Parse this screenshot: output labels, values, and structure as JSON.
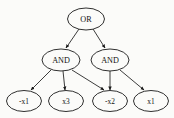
{
  "figure": {
    "background_color": "#fbfbf9",
    "stroke_color": "#1a1a1a",
    "width": 174,
    "height": 118
  },
  "graph": {
    "type": "directed-acyclic-graph",
    "levels": 3,
    "nodes": [
      {
        "id": "or",
        "label": "OR",
        "kind": "gate",
        "level": 0,
        "cx": 86,
        "cy": 19,
        "rx": 18.5,
        "ry": 11.0
      },
      {
        "id": "and1",
        "label": "AND",
        "kind": "gate",
        "level": 1,
        "cx": 61,
        "cy": 60,
        "rx": 19.0,
        "ry": 11.0
      },
      {
        "id": "and2",
        "label": "AND",
        "kind": "gate",
        "level": 1,
        "cx": 110,
        "cy": 60,
        "rx": 19.0,
        "ry": 11.0
      },
      {
        "id": "l1",
        "label": "-x1",
        "kind": "leaf",
        "level": 2,
        "cx": 24,
        "cy": 101,
        "rx": 17.5,
        "ry": 10.5
      },
      {
        "id": "l2",
        "label": "x3",
        "kind": "leaf",
        "level": 2,
        "cx": 66,
        "cy": 101,
        "rx": 17.5,
        "ry": 10.5
      },
      {
        "id": "l3",
        "label": "-x2",
        "kind": "leaf",
        "level": 2,
        "cx": 110,
        "cy": 101,
        "rx": 17.5,
        "ry": 10.5
      },
      {
        "id": "l4",
        "label": "x1",
        "kind": "leaf",
        "level": 2,
        "cx": 151,
        "cy": 101,
        "rx": 17.5,
        "ry": 10.5
      }
    ],
    "edges": [
      {
        "from": "or",
        "to": "and1",
        "x1": 79,
        "y1": 29,
        "x2": 66,
        "y2": 48
      },
      {
        "from": "or",
        "to": "and2",
        "x1": 93,
        "y1": 29,
        "x2": 105,
        "y2": 48
      },
      {
        "from": "and1",
        "to": "l1",
        "x1": 51,
        "y1": 70,
        "x2": 31,
        "y2": 90
      },
      {
        "from": "and1",
        "to": "l2",
        "x1": 63,
        "y1": 71,
        "x2": 65,
        "y2": 90
      },
      {
        "from": "and1",
        "to": "l3",
        "x1": 72,
        "y1": 70,
        "x2": 104,
        "y2": 90
      },
      {
        "from": "and2",
        "to": "l3",
        "x1": 110,
        "y1": 71,
        "x2": 110,
        "y2": 90
      },
      {
        "from": "and2",
        "to": "l4",
        "x1": 120,
        "y1": 70,
        "x2": 144,
        "y2": 90
      }
    ]
  }
}
